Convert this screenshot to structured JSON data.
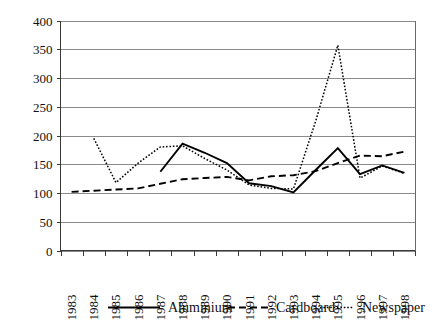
{
  "chart_data": {
    "type": "line",
    "title": "",
    "subtitle": "",
    "xlabel": "",
    "ylabel": "",
    "categories": [
      "1983",
      "1984",
      "1985",
      "1986",
      "1987",
      "1988",
      "1989",
      "1990",
      "1991",
      "1992",
      "1993",
      "1994",
      "1995",
      "1996",
      "1997",
      "1998"
    ],
    "ylim": [
      0,
      400
    ],
    "ytick_values": [
      0,
      50,
      100,
      150,
      200,
      250,
      300,
      350,
      400
    ],
    "ytick_labels": [
      "0",
      "50",
      "100",
      "150",
      "200",
      "250",
      "300",
      "350",
      "400"
    ],
    "grid": true,
    "legend_position": "bottom",
    "series": [
      {
        "name": "Aluminium",
        "style": "solid",
        "color": "#000000",
        "values": [
          null,
          null,
          null,
          null,
          137,
          186,
          170,
          152,
          117,
          112,
          101,
          140,
          178,
          133,
          148,
          135
        ]
      },
      {
        "name": "Cardboard",
        "style": "dashed",
        "color": "#000000",
        "values": [
          102,
          104,
          106,
          108,
          116,
          124,
          126,
          128,
          122,
          129,
          131,
          138,
          152,
          165,
          164,
          172
        ]
      },
      {
        "name": "Newspaper",
        "style": "dotted",
        "color": "#000000",
        "values": [
          null,
          195,
          118,
          152,
          180,
          182,
          160,
          140,
          114,
          108,
          107,
          225,
          357,
          126,
          147,
          134
        ]
      }
    ]
  },
  "legend": {
    "items": [
      {
        "label": "Aluminium",
        "style": "solid"
      },
      {
        "label": "Cardboard",
        "style": "dashed"
      },
      {
        "label": "Newspaper",
        "style": "dotted"
      }
    ]
  }
}
